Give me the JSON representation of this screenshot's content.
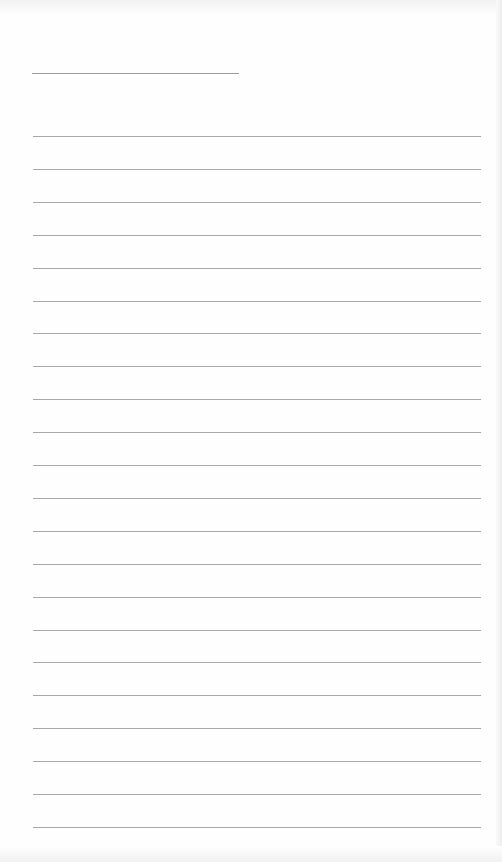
{
  "page": {
    "type": "blank ruled writing sheet",
    "title_line": {
      "visible": true,
      "text": ""
    },
    "ruled_line_count": 22,
    "lines": [
      {
        "text": ""
      },
      {
        "text": ""
      },
      {
        "text": ""
      },
      {
        "text": ""
      },
      {
        "text": ""
      },
      {
        "text": ""
      },
      {
        "text": ""
      },
      {
        "text": ""
      },
      {
        "text": ""
      },
      {
        "text": ""
      },
      {
        "text": ""
      },
      {
        "text": ""
      },
      {
        "text": ""
      },
      {
        "text": ""
      },
      {
        "text": ""
      },
      {
        "text": ""
      },
      {
        "text": ""
      },
      {
        "text": ""
      },
      {
        "text": ""
      },
      {
        "text": ""
      },
      {
        "text": ""
      },
      {
        "text": ""
      }
    ],
    "colors": {
      "paper": "#fefefe",
      "rule": "#a8a8a8",
      "title_rule": "#9c9c9c"
    }
  }
}
